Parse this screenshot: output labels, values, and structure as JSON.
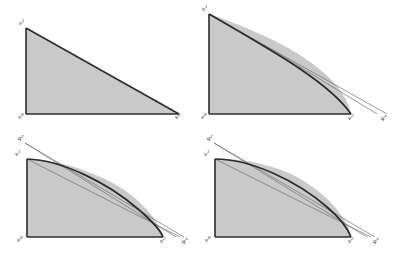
{
  "figure": {
    "fill_color": "#c9c9c9",
    "stroke_color": "#2b2b2b",
    "thin_line_color": "#6f6f6f",
    "background": "#ffffff",
    "panels": [
      {
        "id": "panel-a",
        "description": "Initial triangular outer approximation with no supporting cuts",
        "labels": [
          {
            "name": "vertex-label-v1-top",
            "base": "v",
            "sup": "1",
            "x": 20,
            "y": 24
          },
          {
            "name": "vertex-label-v0-origin",
            "base": "v",
            "sup": "0",
            "x": 20,
            "y": 112
          },
          {
            "name": "vertex-label-v2-right",
            "base": "v",
            "sup": "2",
            "x": 176,
            "y": 112
          }
        ],
        "curve_count": 0,
        "thin_line_count": 0
      },
      {
        "id": "panel-b",
        "description": "One cut added; curved boundary appears near the right vertex, two thin supporting lines meet at q",
        "labels": [
          {
            "name": "vertex-label-v1-top",
            "base": "v",
            "sup": "1",
            "x": 6,
            "y": 10
          },
          {
            "name": "vertex-label-v0-origin",
            "base": "v",
            "sup": "0",
            "x": 4,
            "y": 113
          },
          {
            "name": "vertex-label-v2-right",
            "base": "v",
            "sup": "2",
            "x": 153,
            "y": 114
          },
          {
            "name": "vertex-label-qx-right",
            "base": "q",
            "sup": "x",
            "x": 180,
            "y": 114
          }
        ],
        "curve_count": 1,
        "thin_line_count": 2
      },
      {
        "id": "panel-c",
        "description": "Two cuts; the upper-left corner is now also trimmed, q-prime sits above the v-prime vertex",
        "labels": [
          {
            "name": "vertex-label-qy-top",
            "base": "q",
            "sup": "y",
            "x": 19,
            "y": 10
          },
          {
            "name": "vertex-label-v1-top",
            "base": "v",
            "sup": "1",
            "x": 16,
            "y": 24
          },
          {
            "name": "vertex-label-v0-origin",
            "base": "v",
            "sup": "0",
            "x": 18,
            "y": 234
          },
          {
            "name": "vertex-label-v2-right",
            "base": "v",
            "sup": "2",
            "x": 153,
            "y": 235
          },
          {
            "name": "vertex-label-qx-right",
            "base": "q",
            "sup": "x",
            "x": 178,
            "y": 235
          }
        ],
        "curve_count": 1,
        "thin_line_count": 3
      },
      {
        "id": "panel-d",
        "description": "Final refinement; the approximation hugs the convex curve on both ends",
        "labels": [
          {
            "name": "vertex-label-qy-top",
            "base": "q",
            "sup": "y",
            "x": 7,
            "y": 10
          },
          {
            "name": "vertex-label-v1-top",
            "base": "v",
            "sup": "1",
            "x": 4,
            "y": 24
          },
          {
            "name": "vertex-label-v0-origin",
            "base": "v",
            "sup": "0",
            "x": 5,
            "y": 234
          },
          {
            "name": "vertex-label-v2-right",
            "base": "v",
            "sup": "2",
            "x": 154,
            "y": 235
          },
          {
            "name": "vertex-label-qx-right",
            "base": "q",
            "sup": "x",
            "x": 179,
            "y": 235
          }
        ],
        "curve_count": 1,
        "thin_line_count": 3
      }
    ]
  }
}
